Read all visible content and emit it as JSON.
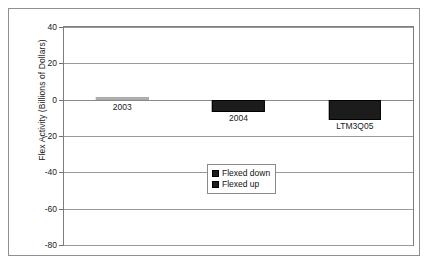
{
  "chart_data": {
    "type": "bar",
    "title": "",
    "subtitle": "",
    "xlabel": "",
    "ylabel": "Flex Activity (Billions of Dollars)",
    "categories": [
      "2003",
      "2004",
      "LTM3Q05"
    ],
    "values": [
      -0.3,
      -7,
      -11
    ],
    "series": [
      {
        "name": "Flexed down",
        "values": [
          -0.3,
          -7,
          -11
        ]
      },
      {
        "name": "Flexed up",
        "values": [
          0,
          0,
          0
        ]
      }
    ],
    "ylim": [
      -80,
      40
    ],
    "ytick_labels": [
      "40",
      "20",
      "0",
      "-20",
      "-40",
      "-60",
      "-80"
    ],
    "ytick_values": [
      40,
      20,
      0,
      -20,
      -40,
      -60,
      -80
    ],
    "grid": true,
    "legend_position": "bottom-center",
    "legend_entries": [
      {
        "label": "Flexed down",
        "color": "#1c1c1c"
      },
      {
        "label": "Flexed up",
        "color": "#1c1c1c"
      }
    ],
    "bar_color": "#1c1c1c",
    "sliver_color": "#b4b4b4",
    "axis_color": "#7d7d7d",
    "grid_color": "#9a9a9a",
    "frame_color": "#8f8f8f",
    "background": "#ffffff"
  }
}
